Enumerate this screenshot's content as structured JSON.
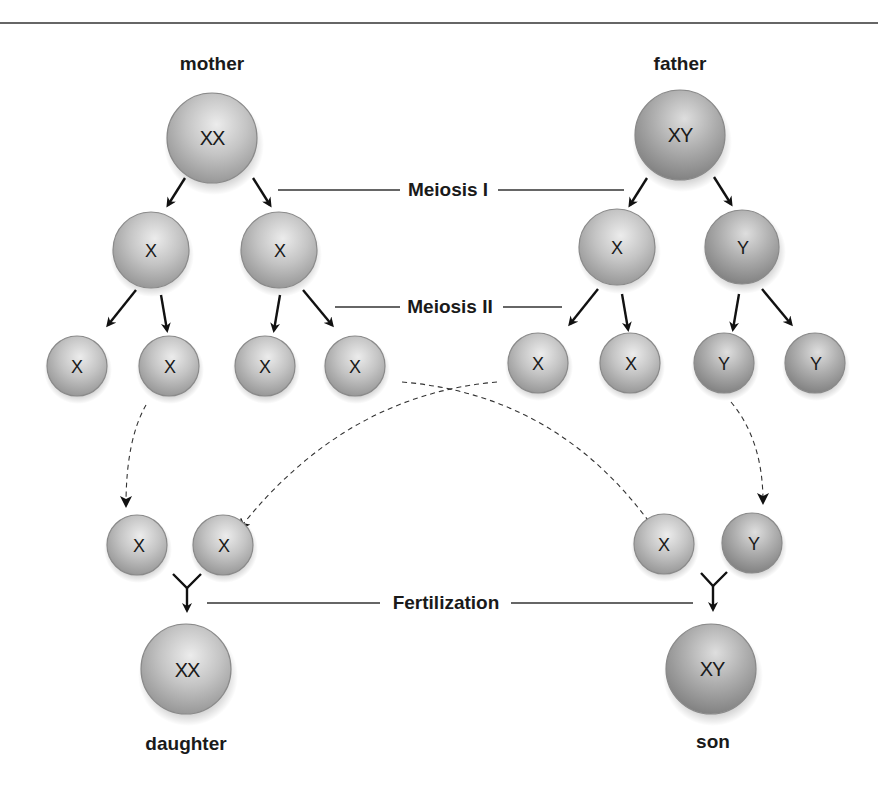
{
  "parents": {
    "mother": {
      "label": "mother",
      "genotype": "XX"
    },
    "father": {
      "label": "father",
      "genotype": "XY"
    }
  },
  "stages": {
    "meiosis1": "Meiosis I",
    "meiosis2": "Meiosis II",
    "fertilization": "Fertilization"
  },
  "meiosis1_products": {
    "mother": [
      "X",
      "X"
    ],
    "father": [
      "X",
      "Y"
    ]
  },
  "gametes": {
    "mother": [
      "X",
      "X",
      "X",
      "X"
    ],
    "father": [
      "X",
      "X",
      "Y",
      "Y"
    ]
  },
  "fertilization_pairs": {
    "daughter": [
      "X",
      "X"
    ],
    "son": [
      "X",
      "Y"
    ]
  },
  "offspring": {
    "daughter": {
      "label": "daughter",
      "genotype": "XX"
    },
    "son": {
      "label": "son",
      "genotype": "XY"
    }
  },
  "colors": {
    "cell_light": "#e6e6e6",
    "cell_mid": "#b5b5b5",
    "cell_dark": "#7d7d7d",
    "ink": "#1a1a1a"
  }
}
